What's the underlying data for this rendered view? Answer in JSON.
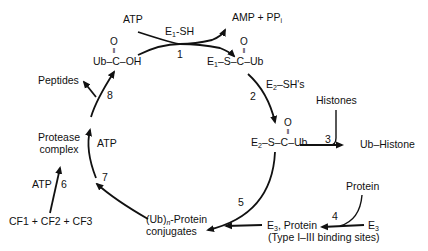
{
  "nodes": {
    "atp_top": "ATP",
    "e1sh": "E1-SH",
    "amp_ppi": "AMP + PPi",
    "ub_cooh": "Ub–C–OH",
    "e1_s_ub": "E1–S–C–Ub",
    "e2sh": "E2–SH's",
    "histones": "Histones",
    "e2_s_ub": "E2–S–C–Ub",
    "ub_histone": "Ub–Histone",
    "peptides": "Peptides",
    "protease_l1": "Protease",
    "protease_l2": "complex",
    "atp_7": "ATP",
    "atp_6": "ATP",
    "cf": "CF1 + CF2 + CF3",
    "conj_l1": "(Ub)n-Protein",
    "conj_l2": "conjugates",
    "protein": "Protein",
    "e3_protein": "E3, Protein",
    "e3": "E3",
    "binding_sites": "(Type I–III binding sites)",
    "oxygen": "O"
  },
  "steps": [
    "1",
    "2",
    "3",
    "4",
    "5",
    "6",
    "7",
    "8"
  ]
}
